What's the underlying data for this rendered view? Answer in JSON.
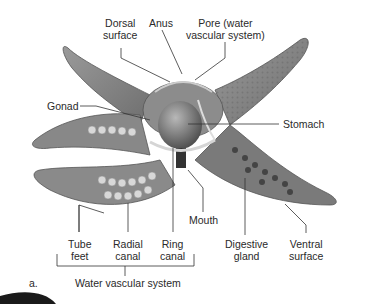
{
  "figure": {
    "panel_letter": "a.",
    "labels": {
      "dorsal_surface": [
        "Dorsal",
        "surface"
      ],
      "anus": "Anus",
      "pore": [
        "Pore (water",
        "vascular system)"
      ],
      "gonad": "Gonad",
      "stomach": "Stomach",
      "mouth": "Mouth",
      "tube_feet": [
        "Tube",
        "feet"
      ],
      "radial_canal": [
        "Radial",
        "canal"
      ],
      "ring_canal": [
        "Ring",
        "canal"
      ],
      "digestive_gland": [
        "Digestive",
        "gland"
      ],
      "ventral_surface": [
        "Ventral",
        "surface"
      ],
      "bracket_group": "Water vascular system"
    }
  }
}
